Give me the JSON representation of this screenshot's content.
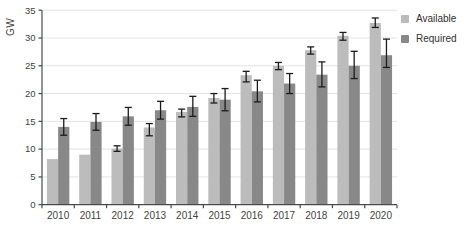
{
  "chart_data": {
    "type": "bar",
    "title": "",
    "xlabel": "",
    "ylabel": "GW",
    "categories": [
      "2010",
      "2011",
      "2012",
      "2013",
      "2014",
      "2015",
      "2016",
      "2017",
      "2018",
      "2019",
      "2020"
    ],
    "ylim": [
      0,
      35
    ],
    "yticks": [
      0,
      5,
      10,
      15,
      20,
      25,
      30,
      35
    ],
    "grid": true,
    "legend_position": "top-right",
    "series": [
      {
        "name": "Available",
        "color": "#bcbcbc",
        "values": [
          8.2,
          9.0,
          10.1,
          13.9,
          16.7,
          19.2,
          23.3,
          25.0,
          27.8,
          30.4,
          32.7
        ],
        "error_low": [
          null,
          null,
          9.6,
          12.4,
          15.8,
          18.3,
          22.1,
          24.3,
          27.1,
          29.6,
          31.9
        ],
        "error_high": [
          null,
          null,
          10.6,
          14.6,
          17.2,
          20.0,
          24.0,
          25.6,
          28.4,
          31.0,
          33.6
        ]
      },
      {
        "name": "Required",
        "color": "#888888",
        "values": [
          14.0,
          14.9,
          15.9,
          17.0,
          17.6,
          18.9,
          20.4,
          21.8,
          23.4,
          25.0,
          26.9
        ],
        "error_low": [
          12.5,
          13.4,
          14.3,
          15.4,
          15.9,
          16.9,
          18.5,
          20.0,
          21.2,
          22.7,
          24.7
        ],
        "error_high": [
          15.5,
          16.4,
          17.5,
          18.6,
          19.5,
          20.9,
          22.4,
          23.6,
          25.7,
          27.6,
          29.8
        ]
      }
    ]
  },
  "colors": {
    "background": "#ffffff",
    "gridline": "#e3e3e3",
    "axis": "#4a4a4a",
    "tick_text": "#3f3f3f",
    "error_bar": "#1c1c1c",
    "available": "#bcbcbc",
    "required": "#888888"
  }
}
